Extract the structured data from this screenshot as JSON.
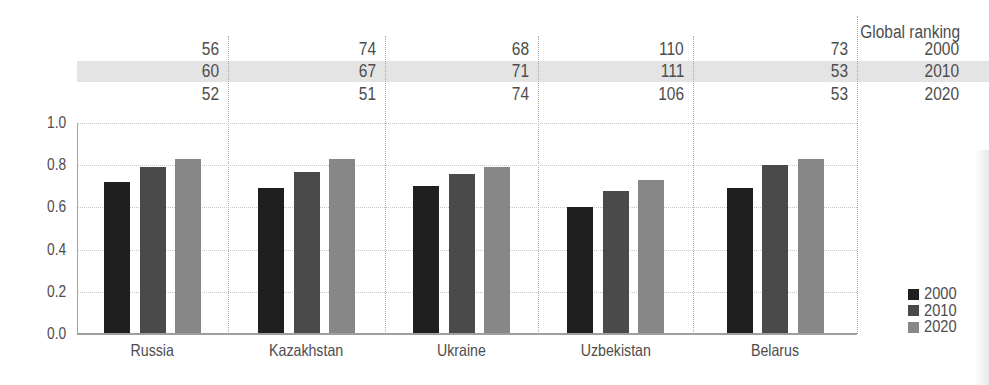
{
  "figure": {
    "text_color": "#4d4d4d",
    "band_color": "#e4e4e4",
    "background": "#ffffff"
  },
  "chart_data": {
    "type": "bar",
    "title": "",
    "xlabel": "",
    "ylabel": "",
    "categories": [
      "Russia",
      "Kazakhstan",
      "Ukraine",
      "Uzbekistan",
      "Belarus"
    ],
    "series": [
      {
        "name": "2000",
        "color": "#1f1f1f",
        "values": [
          0.72,
          0.69,
          0.7,
          0.6,
          0.69
        ]
      },
      {
        "name": "2010",
        "color": "#4a4a4a",
        "values": [
          0.79,
          0.77,
          0.76,
          0.68,
          0.8
        ]
      },
      {
        "name": "2020",
        "color": "#878787",
        "values": [
          0.83,
          0.83,
          0.79,
          0.73,
          0.83
        ]
      }
    ],
    "ylim": [
      0,
      1.0
    ],
    "yticks": [
      "1.0",
      "0.8",
      "0.6",
      "0.4",
      "0.2",
      "0.0"
    ],
    "grid": "horizontal-dotted",
    "legend_position": "bottom-right",
    "legend_entries": [
      "2000",
      "2010",
      "2020"
    ],
    "global_ranking": {
      "header": "Global ranking",
      "years": [
        "2000",
        "2010",
        "2020"
      ],
      "highlighted_year": "2010",
      "values": {
        "Russia": [
          56,
          60,
          52
        ],
        "Kazakhstan": [
          74,
          67,
          51
        ],
        "Ukraine": [
          68,
          71,
          74
        ],
        "Uzbekistan": [
          110,
          111,
          106
        ],
        "Belarus": [
          73,
          53,
          53
        ]
      }
    }
  }
}
